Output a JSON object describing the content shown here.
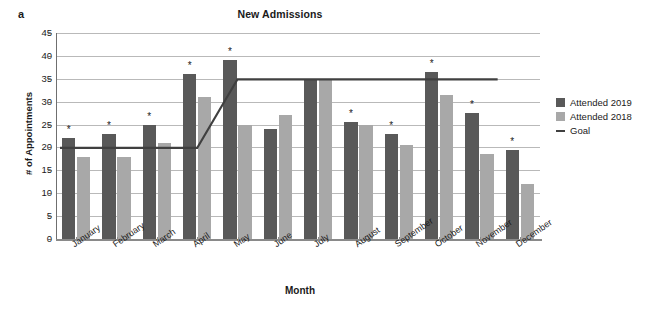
{
  "panel": {
    "label": "a"
  },
  "chart_data": {
    "type": "bar",
    "title": "New Admissions",
    "xlabel": "Month",
    "ylabel": "# of Appointments",
    "ylim": [
      0,
      45
    ],
    "ytick_step": 5,
    "yticks": [
      45,
      40,
      35,
      30,
      25,
      20,
      15,
      10,
      5,
      0
    ],
    "grid": true,
    "legend_position": "right",
    "categories": [
      "January",
      "February",
      "March",
      "April",
      "May",
      "June",
      "July",
      "August",
      "September",
      "October",
      "November",
      "December"
    ],
    "series": [
      {
        "name": "Attended 2019",
        "color": "#595959",
        "values": [
          22,
          23,
          25,
          36,
          39,
          24,
          35,
          25.5,
          23,
          36.5,
          27.5,
          19.5
        ]
      },
      {
        "name": "Attended 2018",
        "color": "#a8a8a8",
        "values": [
          18,
          18,
          21,
          31,
          25,
          27,
          35,
          25,
          20.5,
          31.5,
          18.5,
          12
        ]
      }
    ],
    "goal_line": {
      "name": "Goal",
      "color": "#404040",
      "values": [
        20,
        20,
        20,
        20,
        35,
        35,
        35,
        35,
        35,
        35,
        35,
        null
      ]
    },
    "significance_marker": "*",
    "significant_months": [
      "January",
      "February",
      "March",
      "April",
      "May",
      "August",
      "September",
      "October",
      "November",
      "December"
    ]
  },
  "legend": {
    "items": [
      {
        "label": "Attended 2019",
        "marker": "square-dark-icon"
      },
      {
        "label": "Attended 2018",
        "marker": "square-light-icon"
      },
      {
        "label": "Goal",
        "marker": "line-dash-icon"
      }
    ]
  }
}
